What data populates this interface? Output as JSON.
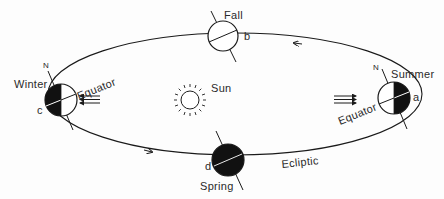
{
  "diagram": {
    "type": "earth-orbit-seasons",
    "orbit_label": "Ecliptic",
    "sun_label": "Sun",
    "positions": [
      {
        "season": "Summer",
        "letter": "a",
        "pole_label": "N",
        "equator_label": "Equator",
        "lit_side": "left",
        "dark_side": "right"
      },
      {
        "season": "Fall",
        "letter": "b",
        "lit_side": "full",
        "dark_side": "none"
      },
      {
        "season": "Winter",
        "letter": "c",
        "pole_label": "N",
        "equator_label": "Equator",
        "lit_side": "right",
        "dark_side": "left"
      },
      {
        "season": "Spring",
        "letter": "d",
        "lit_side": "none",
        "dark_side": "full"
      }
    ],
    "orbit_direction": "counterclockwise",
    "sunlight_arrows": {
      "left_group": "pointing-left",
      "right_group": "pointing-right",
      "count_per_group": 3
    },
    "colors": {
      "ink": "#1a1a1a",
      "background": "#fdfdfd"
    }
  },
  "labels": {
    "summer": "Summer",
    "summer_letter": "a",
    "summer_n": "N",
    "summer_equator": "Equator",
    "fall": "Fall",
    "fall_letter": "b",
    "winter": "Winter",
    "winter_letter": "c",
    "winter_n": "N",
    "winter_equator": "Equator",
    "spring": "Spring",
    "spring_letter": "d",
    "sun": "Sun",
    "ecliptic": "Ecliptic"
  }
}
